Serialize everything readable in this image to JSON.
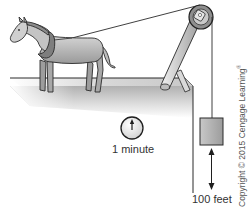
{
  "figure": {
    "clock_label": "1 minute",
    "distance_label": "100 feet",
    "copyright": "Copyright © 2015 Cengage Learning",
    "copyright_mark": "®"
  },
  "icons": {
    "horse": "horse-illustration",
    "pulley": "pulley-wheel",
    "clock": "clock-icon",
    "weight": "weight-block",
    "arrow": "double-arrow"
  },
  "colors": {
    "outline": "#2a2a2a",
    "fill_light": "#e6e6e6",
    "fill_mid": "#b5b5b5",
    "fill_dark": "#8a8a8a",
    "background": "#ffffff"
  }
}
